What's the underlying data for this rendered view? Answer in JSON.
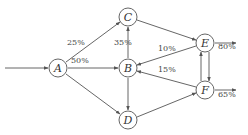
{
  "diagram": {
    "type": "flow-network",
    "nodes": [
      {
        "id": "A",
        "label": "A"
      },
      {
        "id": "B",
        "label": "B"
      },
      {
        "id": "C",
        "label": "C"
      },
      {
        "id": "D",
        "label": "D"
      },
      {
        "id": "E",
        "label": "E"
      },
      {
        "id": "F",
        "label": "F"
      }
    ],
    "edges": [
      {
        "from": "input",
        "to": "A",
        "label": ""
      },
      {
        "from": "A",
        "to": "C",
        "label": "25%"
      },
      {
        "from": "A",
        "to": "B",
        "label": "50%"
      },
      {
        "from": "A",
        "to": "D",
        "label": ""
      },
      {
        "from": "B",
        "to": "C",
        "label": "35%"
      },
      {
        "from": "B",
        "to": "D",
        "label": ""
      },
      {
        "from": "C",
        "to": "E",
        "label": ""
      },
      {
        "from": "E",
        "to": "B",
        "label": "10%"
      },
      {
        "from": "F",
        "to": "B",
        "label": "15%"
      },
      {
        "from": "D",
        "to": "F",
        "label": ""
      },
      {
        "from": "E",
        "to": "F",
        "label": ""
      },
      {
        "from": "F",
        "to": "E",
        "label": ""
      },
      {
        "from": "E",
        "to": "output",
        "label": "80%"
      },
      {
        "from": "F",
        "to": "output",
        "label": "65%"
      }
    ]
  }
}
